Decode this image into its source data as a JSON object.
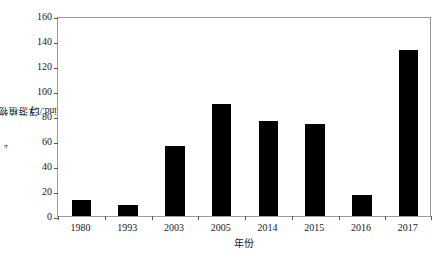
{
  "chart_data": {
    "type": "bar",
    "title": "",
    "subtitle": "",
    "xlabel": "年份",
    "ylabel": "浮游植物丰度/(10⁴ ind./L)",
    "ylabel_prefix": "浮游植物丰度/(10",
    "ylabel_exponent": "4",
    "ylabel_suffix": " ind./L)",
    "categories": [
      "1980",
      "1993",
      "2003",
      "2005",
      "2014",
      "2015",
      "2016",
      "2017"
    ],
    "values": [
      13,
      9,
      56,
      90,
      76,
      74,
      17,
      133
    ],
    "series": [
      {
        "name": "浮游植物丰度",
        "values": [
          13,
          9,
          56,
          90,
          76,
          74,
          17,
          133
        ]
      }
    ],
    "ylim": [
      0,
      160
    ],
    "yticks": [
      0,
      20,
      40,
      60,
      80,
      100,
      120,
      140,
      160
    ],
    "ytick_labels": [
      "0",
      "20",
      "40",
      "60",
      "80",
      "100",
      "120",
      "140",
      "160"
    ],
    "xtick_labels": [
      "1980",
      "1993",
      "2003",
      "2005",
      "2014",
      "2015",
      "2016",
      "2017"
    ],
    "grid": false,
    "legend": false,
    "legend_position": "none",
    "bar_color": "#000000",
    "axis_color": "#9a9a9a",
    "tick_color": "#5a5a5a",
    "background_color": "#ffffff",
    "bar_width_ratio": 0.42,
    "annotations": []
  }
}
